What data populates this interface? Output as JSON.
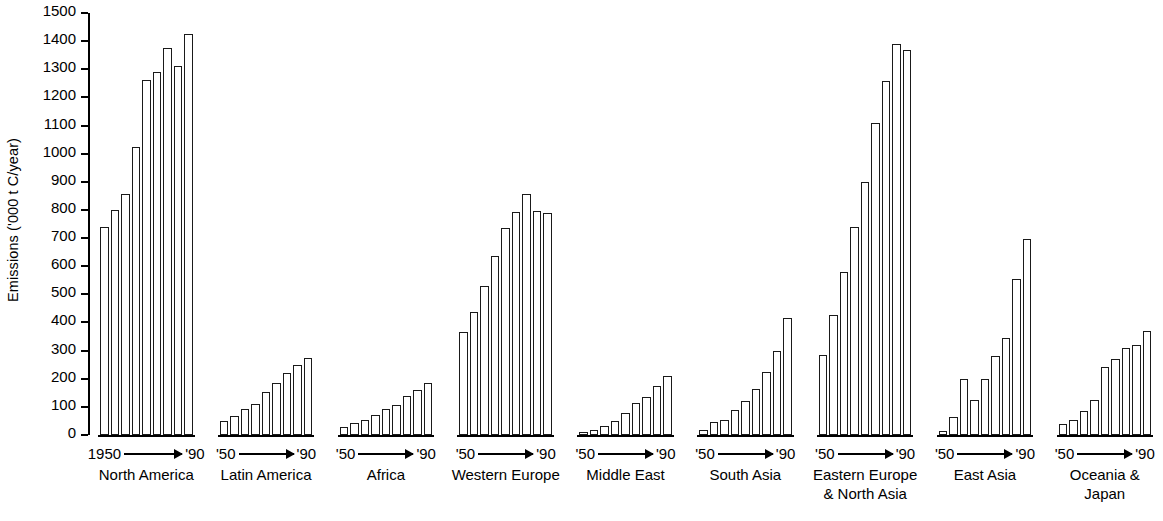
{
  "chart_data": {
    "type": "bar",
    "title": "",
    "xlabel": "",
    "ylabel": "Emissions ('000 t C/year)",
    "ylim": [
      0,
      1500
    ],
    "ytick_step": 100,
    "yticks": [
      0,
      100,
      200,
      300,
      400,
      500,
      600,
      700,
      800,
      900,
      1000,
      1100,
      1200,
      1300,
      1400,
      1500
    ],
    "ytick_labels": [
      "0",
      "100",
      "200",
      "300",
      "400",
      "500",
      "600",
      "700",
      "800",
      "900",
      "1000",
      "1100",
      "1200",
      "1300",
      "1400",
      "1500"
    ],
    "grid": false,
    "legend": "none",
    "bar_fill": "#ffffff",
    "bar_stroke": "#1a1a1a",
    "x_categories": [
      "1950",
      "1955",
      "1960",
      "1965",
      "1970",
      "1975",
      "1980",
      "1985",
      "1990"
    ],
    "groups": [
      {
        "name": "North America",
        "range_start_label": "1950",
        "range_end_label": "'90",
        "values": [
          740,
          800,
          855,
          1022,
          1262,
          1292,
          1375,
          1312,
          1425
        ]
      },
      {
        "name": "Latin America",
        "range_start_label": "'50",
        "range_end_label": "'90",
        "values": [
          50,
          68,
          92,
          112,
          152,
          185,
          222,
          248,
          275
        ]
      },
      {
        "name": "Africa",
        "range_start_label": "'50",
        "range_end_label": "'90",
        "values": [
          30,
          42,
          55,
          72,
          92,
          105,
          138,
          160,
          185
        ]
      },
      {
        "name": "Western Europe",
        "range_start_label": "'50",
        "range_end_label": "'90",
        "values": [
          365,
          438,
          530,
          635,
          735,
          792,
          858,
          795,
          790
        ]
      },
      {
        "name": "Middle East",
        "range_start_label": "'50",
        "range_end_label": "'90",
        "values": [
          10,
          18,
          32,
          50,
          80,
          115,
          135,
          175,
          210
        ]
      },
      {
        "name": "South Asia",
        "range_start_label": "'50",
        "range_end_label": "'90",
        "values": [
          18,
          45,
          55,
          90,
          120,
          165,
          225,
          300,
          415
        ]
      },
      {
        "name": "Eastern Europe & North Asia",
        "range_start_label": "'50",
        "range_end_label": "'90",
        "values": [
          285,
          425,
          580,
          740,
          900,
          1110,
          1260,
          1390,
          1370
        ]
      },
      {
        "name": "East Asia",
        "range_start_label": "'50",
        "range_end_label": "'90",
        "values": [
          15,
          65,
          200,
          125,
          200,
          280,
          345,
          555,
          695
        ]
      },
      {
        "name": "Oceania & Japan",
        "range_start_label": "'50",
        "range_end_label": "'90",
        "values": [
          40,
          55,
          85,
          125,
          240,
          270,
          310,
          320,
          370
        ]
      }
    ]
  }
}
